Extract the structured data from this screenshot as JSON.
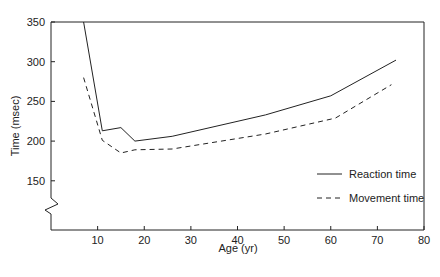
{
  "chart_data": {
    "type": "line",
    "title": "",
    "xlabel": "Age (yr)",
    "ylabel": "Time (msec)",
    "xlim": [
      0,
      80
    ],
    "ylim": [
      100,
      350
    ],
    "xticks": [
      10,
      20,
      30,
      40,
      50,
      60,
      70,
      80
    ],
    "yticks": [
      150,
      200,
      250,
      300,
      350
    ],
    "y_axis_break": true,
    "grid": false,
    "legend_position": "lower right",
    "series": [
      {
        "name": "Reaction time",
        "style": "solid",
        "x": [
          7,
          11,
          15,
          18,
          26,
          46,
          60,
          74
        ],
        "y": [
          350,
          213,
          217,
          200,
          206,
          233,
          257,
          302
        ]
      },
      {
        "name": "Movement time",
        "style": "dashed",
        "x": [
          7,
          11,
          15,
          18,
          26,
          46,
          61,
          73
        ],
        "y": [
          280,
          201,
          185,
          189,
          190,
          209,
          229,
          271
        ]
      }
    ]
  },
  "labels": {
    "xlabel": "Age (yr)",
    "ylabel": "Time (msec)",
    "legend": [
      "Reaction time",
      "Movement time"
    ],
    "yticks": [
      "150",
      "200",
      "250",
      "300",
      "350"
    ],
    "xticks": [
      "10",
      "20",
      "30",
      "40",
      "50",
      "60",
      "70",
      "80"
    ]
  }
}
